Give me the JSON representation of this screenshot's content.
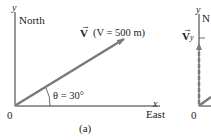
{
  "panel_a": {
    "y_axis_label": "y",
    "north_label": "North",
    "vector_symbol": "V",
    "vector_annotation": "(V = 500 m)",
    "angle_label": "θ = 30°",
    "x_axis_label": "x",
    "east_label": "East",
    "origin_label": "0",
    "caption": "(a)",
    "vector_color": "#7a7a7a",
    "axis_color": "#333333"
  },
  "panel_b": {
    "y_axis_label": "y",
    "north_label": "N",
    "component_symbol": "V",
    "component_subscript": "y",
    "origin_label": "0"
  }
}
